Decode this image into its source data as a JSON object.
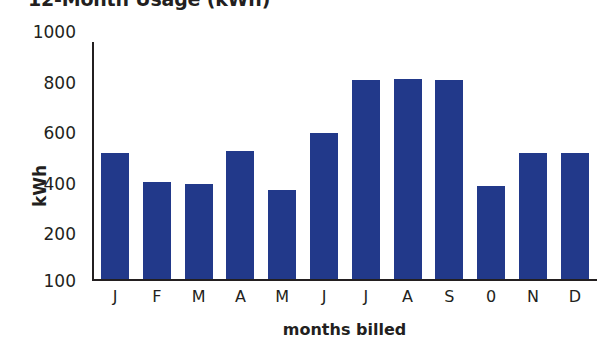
{
  "chart_data": {
    "type": "bar",
    "title": "12-Month Usage (kWh)",
    "xlabel": "months billed",
    "ylabel": "kWh",
    "categories": [
      "J",
      "F",
      "M",
      "A",
      "M",
      "J",
      "J",
      "A",
      "S",
      "0",
      "N",
      "D"
    ],
    "values": [
      520,
      405,
      400,
      530,
      375,
      600,
      810,
      815,
      810,
      390,
      520,
      520
    ],
    "yticks": [
      "1000",
      "800",
      "600",
      "400",
      "200",
      "100"
    ],
    "ylim": [
      100,
      1000
    ],
    "grid": false,
    "legend": null,
    "bar_color": "#22398a"
  }
}
